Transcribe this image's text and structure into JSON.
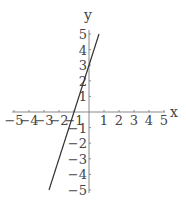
{
  "chart_data": {
    "type": "line",
    "title": "",
    "xlabel": "x",
    "ylabel": "y",
    "xlim": [
      -5,
      5
    ],
    "ylim": [
      -5,
      5
    ],
    "grid": false,
    "x_ticks": [
      -5,
      -4,
      -3,
      -2,
      -1,
      1,
      2,
      3,
      4,
      5
    ],
    "y_ticks": [
      -5,
      -4,
      -3,
      -2,
      -1,
      1,
      2,
      3,
      4,
      5
    ],
    "x_tick_labels": [
      "-5",
      "-4",
      "-3",
      "-2",
      "-1",
      "1",
      "2",
      "3",
      "4",
      "5"
    ],
    "y_tick_labels": [
      "-5",
      "-4",
      "-3",
      "-2",
      "-1",
      "1",
      "2",
      "3",
      "4",
      "5"
    ],
    "series": [
      {
        "name": "y = 3x + 3",
        "x": [
          -2.667,
          0.667
        ],
        "y": [
          -5,
          5
        ]
      }
    ]
  },
  "colors": {
    "axis": "#888888",
    "line": "#333333",
    "text": "#444444"
  }
}
